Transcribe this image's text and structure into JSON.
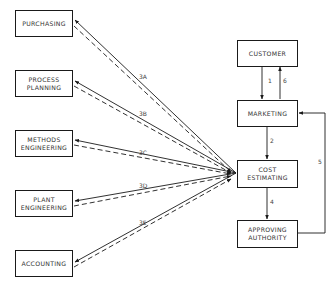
{
  "diagram": {
    "left_boxes": [
      {
        "id": "purchasing",
        "label": "PURCHASING",
        "x": 15,
        "y": 10
      },
      {
        "id": "process-planning",
        "label": "PROCESS\nPLANNING",
        "x": 15,
        "y": 70
      },
      {
        "id": "methods-engineering",
        "label": "METHODS\nENGINEERING",
        "x": 15,
        "y": 130
      },
      {
        "id": "plant-engineering",
        "label": "PLANT\nENGINEERING",
        "x": 15,
        "y": 190
      },
      {
        "id": "accounting",
        "label": "ACCOUNTING",
        "x": 15,
        "y": 250
      }
    ],
    "right_boxes": [
      {
        "id": "customer",
        "label": "CUSTOMER",
        "x": 237,
        "y": 40
      },
      {
        "id": "marketing",
        "label": "MARKETING",
        "x": 237,
        "y": 100
      },
      {
        "id": "cost-estimating",
        "label": "COST\nESTIMATING",
        "x": 237,
        "y": 160
      },
      {
        "id": "approving-authority",
        "label": "APPROVING\nAUTHORITY",
        "x": 237,
        "y": 220
      }
    ],
    "edge_labels": [
      {
        "text": "1",
        "x": 268,
        "y": 80
      },
      {
        "text": "6",
        "x": 283,
        "y": 80
      },
      {
        "text": "2",
        "x": 270,
        "y": 140
      },
      {
        "text": "3A",
        "x": 139,
        "y": 76
      },
      {
        "text": "3B",
        "x": 139,
        "y": 113
      },
      {
        "text": "3C",
        "x": 139,
        "y": 152
      },
      {
        "text": "3D",
        "x": 139,
        "y": 185
      },
      {
        "text": "3E",
        "x": 139,
        "y": 222
      },
      {
        "text": "4",
        "x": 270,
        "y": 201
      },
      {
        "text": "5",
        "x": 318,
        "y": 161
      }
    ]
  }
}
